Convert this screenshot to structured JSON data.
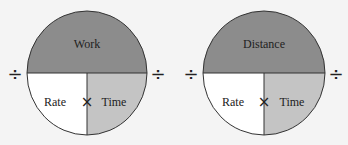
{
  "diagrams": [
    {
      "top_label": "Work",
      "bottom_left_label": "Rate",
      "bottom_right_label": "Time",
      "multiply_symbol": "×",
      "divide_left": "÷",
      "divide_right": "÷"
    },
    {
      "top_label": "Distance",
      "bottom_left_label": "Rate",
      "bottom_right_label": "Time",
      "multiply_symbol": "×",
      "divide_left": "÷",
      "divide_right": "÷"
    }
  ],
  "colors": {
    "top_fill": "#8c8c8c",
    "bottom_left_fill": "#ffffff",
    "bottom_right_fill": "#c4c4c4",
    "stroke": "#333333",
    "background": "#f4f4f4"
  }
}
